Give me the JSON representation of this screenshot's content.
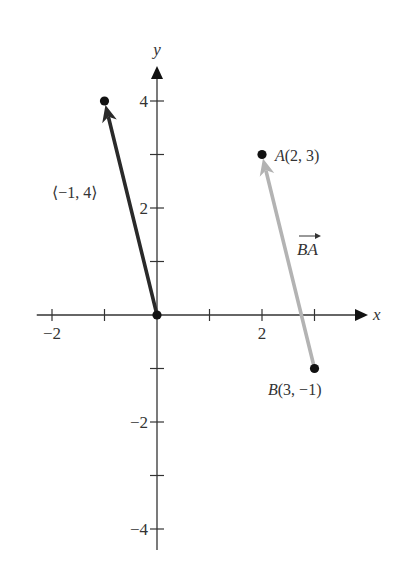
{
  "chart_data": {
    "type": "vector-plot",
    "title": "",
    "xlabel": "x",
    "ylabel": "y",
    "xlim": [
      -2.3,
      4.0
    ],
    "ylim": [
      -4.4,
      4.6
    ],
    "x_ticks": [
      -2,
      -1,
      1,
      2,
      3
    ],
    "x_tick_labels": [
      {
        "value": -2,
        "label": "−2"
      },
      {
        "value": 2,
        "label": "2"
      }
    ],
    "y_ticks": [
      -4,
      -3,
      -2,
      -1,
      1,
      2,
      3,
      4
    ],
    "y_tick_labels": [
      {
        "value": 4,
        "label": "4"
      },
      {
        "value": 2,
        "label": "2"
      },
      {
        "value": -2,
        "label": "−2"
      },
      {
        "value": -4,
        "label": "−4"
      }
    ],
    "vectors": [
      {
        "name": "position-vector",
        "from": [
          0,
          0
        ],
        "to": [
          -1,
          4
        ],
        "label": "⟨−1, 4⟩",
        "color": "#2a2a2a"
      },
      {
        "name": "vector-BA",
        "from": [
          3,
          -1
        ],
        "to": [
          2,
          3
        ],
        "label_main": "BA",
        "label_arrow": "→",
        "color": "#b3b3b3"
      }
    ],
    "points": [
      {
        "name": "origin",
        "x": 0,
        "y": 0,
        "label": ""
      },
      {
        "name": "tip",
        "x": -1,
        "y": 4,
        "label": ""
      },
      {
        "name": "A",
        "x": 2,
        "y": 3,
        "label_letter": "A",
        "label_coords": "(2, 3)"
      },
      {
        "name": "B",
        "x": 3,
        "y": -1,
        "label_letter": "B",
        "label_coords": "(3, −1)"
      }
    ],
    "grid": false,
    "colors": {
      "axis": "#333333",
      "dark_vector": "#2a2a2a",
      "light_vector": "#b3b3b3",
      "point": "#111111"
    }
  }
}
